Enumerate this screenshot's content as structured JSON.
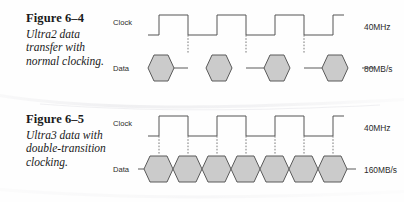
{
  "document": {
    "background_color": "#fefefe",
    "ink_color": "#1a1a1a"
  },
  "colors": {
    "hex_fill": "#cbcbcb",
    "hex_stroke": "#5a5a5a",
    "wave_stroke": "#555555",
    "dotted_edge": "#7a7a7a",
    "text": "#2b2b2b"
  },
  "figures": [
    {
      "id": "figure-6-4",
      "caption_title": "Figure 6–4",
      "caption_text": "Ultra2 data transfer with normal clocking.",
      "signals": [
        {
          "name": "clock",
          "label": "Clock",
          "rate_label": "40MHz"
        },
        {
          "name": "data",
          "label": "Data",
          "rate_label": "80MB/s"
        }
      ],
      "clock": {
        "cycles": 3,
        "duty": "50%",
        "starts_low": true
      },
      "data": {
        "symbol_count": 4,
        "contiguous": false,
        "gap_between_symbols": true,
        "transition_edges": "falling-only",
        "transitions_per_cycle": 1
      }
    },
    {
      "id": "figure-6-5",
      "caption_title": "Figure 6–5",
      "caption_text": "Ultra3 data with double-transition clocking.",
      "signals": [
        {
          "name": "clock",
          "label": "Clock",
          "rate_label": "40MHz"
        },
        {
          "name": "data",
          "label": "Data",
          "rate_label": "160MB/s"
        }
      ],
      "clock": {
        "cycles": 3,
        "duty": "50%",
        "starts_low": true
      },
      "data": {
        "symbol_count": 6,
        "contiguous": true,
        "gap_between_symbols": false,
        "transition_edges": "both",
        "transitions_per_cycle": 2
      }
    }
  ]
}
